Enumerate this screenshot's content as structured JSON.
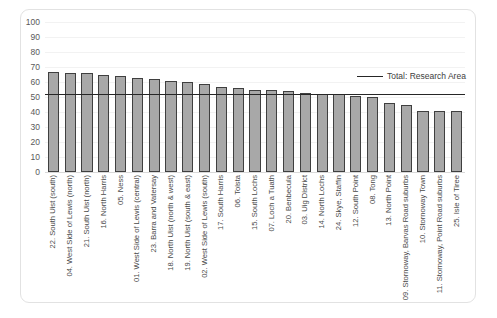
{
  "chart_data": {
    "type": "bar",
    "title": "",
    "xlabel": "",
    "ylabel": "",
    "ylim": [
      0,
      100
    ],
    "ytick_step": 10,
    "yticks": [
      100,
      90,
      80,
      70,
      60,
      50,
      40,
      30,
      20,
      10,
      0
    ],
    "grid": true,
    "legend_position": "inside-top-right",
    "categories": [
      "22. South Uist (south)",
      "04. West Side of Lewis (north)",
      "21. South Uist (north)",
      "16. North Harris",
      "05. Ness",
      "01. West Side of Lewis (central)",
      "23. Barra and Vatersay",
      "18. North Uist (north & west)",
      "19. North Uist (south & east)",
      "02. West Side of Lewis (south)",
      "17. South Harris",
      "06. Tolsta",
      "15. South Lochs",
      "07. Loch a Tuath",
      "20. Benbecula",
      "03. Uig District",
      "14. North Lochs",
      "24. Skye, Staffin",
      "12. South Point",
      "08. Tong",
      "13. North Point",
      "09. Stornoway, Barvas Road suburbs",
      "10. Stornoway Town",
      "11. Stornoway, Point Road suburbs",
      "25. Isle of Tiree"
    ],
    "values": [
      67,
      66,
      66,
      65,
      64,
      63,
      62,
      61,
      60,
      59,
      57,
      56,
      55,
      55,
      54,
      53,
      52,
      52,
      51,
      50,
      46,
      45,
      41,
      41,
      41
    ],
    "series": [
      {
        "name": "Research Area",
        "type": "bar",
        "color": "#a8a8a8",
        "border_color": "#3f3f3f"
      },
      {
        "name": "Total: Research Area",
        "type": "threshold-line",
        "value": 52,
        "color": "#262626"
      }
    ],
    "legend": [
      {
        "label": "Total: Research Area",
        "marker": "line",
        "color": "#262626"
      }
    ]
  },
  "legend": {
    "line_label": "Total: Research Area"
  },
  "colors": {
    "bar_fill": "#a8a8a8",
    "bar_border": "#3f3f3f",
    "threshold": "#262626",
    "gridline": "#f2f2f2",
    "axis": "#d9d9d9",
    "tick_text": "#595959",
    "frame_border": "#e2e2e2",
    "background": "#ffffff"
  }
}
